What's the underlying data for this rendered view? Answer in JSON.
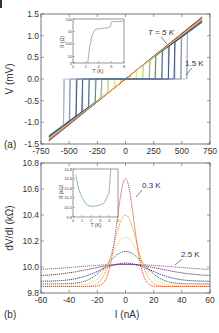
{
  "chart_data": [
    {
      "panel": "(a)",
      "type": "line",
      "title": "",
      "xlabel": "",
      "ylabel": "V (mV)",
      "xlim": [
        -750,
        750
      ],
      "ylim": [
        -1.5,
        1.5
      ],
      "xticks": [
        "-750",
        "-500",
        "-250",
        "0",
        "250",
        "500",
        "750"
      ],
      "yticks": [
        "1.5",
        "1.0",
        "0.5",
        "0.0",
        "-0.5",
        "-1.0",
        "-1.5"
      ],
      "annotations": [
        "T = 5 K",
        "1.5 K"
      ],
      "description": "Family of V-I curves from T = 1.5 K to 5 K; low-T curves show superconducting plateau at V=0 with switching jumps up to about ±550 nA; high-T curves are linear",
      "series": [
        {
          "name": "1.5 K",
          "color": "#8ea2c4",
          "switch_current": 550
        },
        {
          "name": "2 K",
          "color": "#2a3f7a",
          "switch_current": 300
        },
        {
          "name": "3 K",
          "color": "#3b7a58",
          "switch_current": 200
        },
        {
          "name": "4 K",
          "color": "#e8c64a",
          "switch_current": 100
        },
        {
          "name": "4.5 K",
          "color": "#d9673c",
          "switch_current": 0
        },
        {
          "name": "5 K",
          "color": "#7a2a55",
          "switch_current": 0
        }
      ],
      "linear_slope_mV_per_nA": 0.00195,
      "inset": {
        "xlabel": "T (K)",
        "ylabel": "R (Ω)",
        "xlim": [
          0,
          8
        ],
        "xticks": [
          "0",
          "2",
          "4",
          "6",
          "8"
        ],
        "yticks": [
          "10k",
          "1k",
          "100",
          "10",
          "3"
        ],
        "yscale": "log",
        "points": [
          [
            2.3,
            3
          ],
          [
            2.6,
            50
          ],
          [
            3.0,
            500
          ],
          [
            3.5,
            1500
          ],
          [
            5.5,
            2000
          ],
          [
            5.9,
            2500
          ],
          [
            6.0,
            6000
          ],
          [
            8,
            6500
          ]
        ],
        "color": "#7fa6a0"
      }
    },
    {
      "panel": "(b)",
      "type": "line",
      "title": "",
      "xlabel": "I (nA)",
      "ylabel": "dV/dI (kΩ)",
      "xlim": [
        -60,
        60
      ],
      "ylim": [
        9.8,
        10.8
      ],
      "xticks": [
        "-60",
        "-40",
        "-20",
        "0",
        "20",
        "40",
        "60"
      ],
      "yticks": [
        "10.8",
        "10.6",
        "10.4",
        "10.2",
        "10.0",
        "9.8"
      ],
      "annotations": [
        "0.3 K",
        "2.5 K"
      ],
      "series": [
        {
          "name": "0.3 K",
          "color": "#d84a3a",
          "peak": 10.68,
          "baseline": 9.85,
          "width": 6
        },
        {
          "name": "0.6 K",
          "color": "#e89a3a",
          "peak": 10.4,
          "baseline": 9.85,
          "width": 8
        },
        {
          "name": "0.9 K",
          "color": "#f0d070",
          "peak": 10.23,
          "baseline": 9.86,
          "width": 10
        },
        {
          "name": "1.2 K",
          "color": "#2f6a50",
          "peak": 10.12,
          "baseline": 9.87,
          "width": 13
        },
        {
          "name": "1.6 K",
          "color": "#2a3a70",
          "peak": 10.03,
          "baseline": 9.89,
          "width": 18
        },
        {
          "name": "2.0 K",
          "color": "#6a2a6a",
          "peak": 10.02,
          "baseline": 9.93,
          "width": 25
        },
        {
          "name": "2.5 K",
          "color": "#9a5aa0",
          "peak": 10.02,
          "baseline": 9.97,
          "width": 35
        }
      ],
      "inset": {
        "xlabel": "T (K)",
        "ylabel": "R (kΩ)",
        "xlim": [
          0,
          5
        ],
        "ylim": [
          9.8,
          10.8
        ],
        "xticks": [
          "0",
          "1",
          "2",
          "3",
          "4",
          "5"
        ],
        "yticks": [
          "10.8",
          "10.6",
          "10.4",
          "10.2",
          "10.0",
          "9.8"
        ],
        "points": [
          [
            0.3,
            10.68
          ],
          [
            0.6,
            10.4
          ],
          [
            1.0,
            10.2
          ],
          [
            1.5,
            10.06
          ],
          [
            2.0,
            10.02
          ],
          [
            2.5,
            10.03
          ],
          [
            3.0,
            10.05
          ],
          [
            3.5,
            10.1
          ],
          [
            4.0,
            10.3
          ],
          [
            4.2,
            10.8
          ]
        ],
        "color": "#7fa6a0"
      }
    }
  ],
  "labels": {
    "panel_a": "(a)",
    "panel_b": "(b)",
    "a_ylabel": "V (mV)",
    "b_ylabel": "dV/dI  (kΩ)",
    "b_xlabel": "I (nA)",
    "a_ann_5K": "T = 5 K",
    "a_ann_15K": "1.5 K",
    "b_ann_03K": "0.3 K",
    "b_ann_25K": "2.5 K",
    "a_inset_xlabel": "T (K)",
    "a_inset_ylabel": "R (Ω)",
    "b_inset_xlabel": "T (K)",
    "b_inset_ylabel": "R (kΩ)"
  }
}
